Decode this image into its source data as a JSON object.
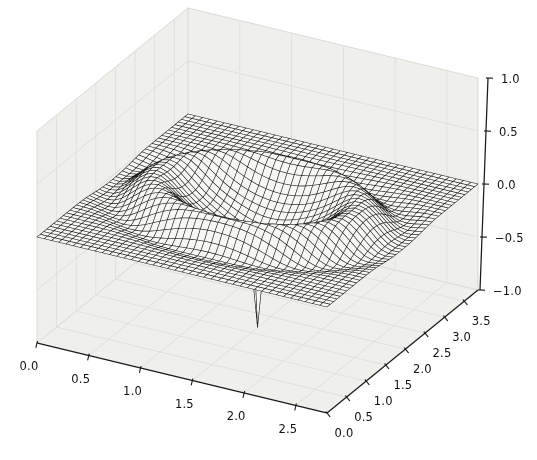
{
  "figure": {
    "width": 537,
    "height": 460,
    "background": "#ffffff"
  },
  "chart_data": {
    "type": "surface",
    "title": "",
    "xlabel": "",
    "ylabel": "",
    "zlabel": "",
    "x_range": [
      0,
      2.8
    ],
    "y_range": [
      0,
      3.85
    ],
    "z_range": [
      -1,
      1
    ],
    "x_tick_values": [
      0.0,
      0.5,
      1.0,
      1.5,
      2.0,
      2.5
    ],
    "x_ticks": [
      "0.0",
      "0.5",
      "1.0",
      "1.5",
      "2.0",
      "2.5"
    ],
    "y_tick_values": [
      0.0,
      0.5,
      1.0,
      1.5,
      2.0,
      2.5,
      3.0,
      3.5
    ],
    "y_ticks": [
      "0.0",
      "0.5",
      "1.0",
      "1.5",
      "2.0",
      "2.5",
      "3.0",
      "3.5"
    ],
    "z_tick_values": [
      1.0,
      0.5,
      0.0,
      -0.5,
      -1.0
    ],
    "z_ticks": [
      "1.0",
      "0.5",
      "0.0",
      "−0.5",
      "−1.0"
    ],
    "view": {
      "azim": -60,
      "elev": 30
    },
    "grid": {
      "nx": 40,
      "ny": 46
    },
    "legend": null,
    "panes_grid_on": true,
    "surface_center": [
      1.4,
      1.925
    ],
    "surface_profile": "radially symmetric about (1.4,1.925): flat plane z=0 far out, shallow outer dip ~-0.06 at r=1.3, raised ridge crest ~+0.22 at r=0.92, crater bowl ~-0.30, narrow central spike down to ~-1.1",
    "radial_components": [
      {
        "shape": "gaussian",
        "amp": 0.22,
        "center": 0.92,
        "width": 0.26
      },
      {
        "shape": "gaussian",
        "amp": -0.3,
        "center": 0.0,
        "width": 0.46
      },
      {
        "shape": "gaussian",
        "amp": -0.06,
        "center": 1.3,
        "width": 0.18
      },
      {
        "shape": "gaussian",
        "amp": -0.8,
        "center": 0.0,
        "width": 0.05
      }
    ],
    "colors": {
      "mesh_line": "#161616",
      "face": "#f7f7f4",
      "pane": "#efefec",
      "pane_grid": "#dcdcda",
      "pane_edge": "#c9c9c6",
      "axis": "#1a1a1a",
      "label": "#111111"
    }
  }
}
